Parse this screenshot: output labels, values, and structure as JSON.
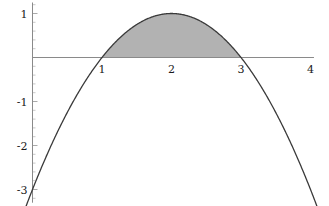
{
  "chart_data": {
    "type": "line",
    "title": "",
    "subtitle": "",
    "xlabel": "",
    "ylabel": "",
    "xlim": [
      -0.48,
      4.25
    ],
    "ylim": [
      -3.3,
      1.3
    ],
    "grid": false,
    "legend": null,
    "background_color": "#ffffff",
    "curve_color": "#3a3a3a",
    "axis_color": "#8a8a8a",
    "shade_color": "#b2b2b2",
    "series": [
      {
        "name": "-x^2 + 4x - 3",
        "type": "line",
        "expression": "y = -(x-2)^2 + 1",
        "color": "#3a3a3a",
        "x": [
          -0.4,
          -0.2,
          0,
          0.2,
          0.4,
          0.6,
          0.8,
          1.0,
          1.2,
          1.4,
          1.6,
          1.8,
          2.0,
          2.2,
          2.4,
          2.6,
          2.8,
          3.0,
          3.2,
          3.4,
          3.6,
          3.8,
          4.0,
          4.1
        ],
        "y": [
          -2.76,
          -1.84,
          -3.0,
          -2.24,
          -1.56,
          -0.96,
          -0.44,
          0.0,
          0.36,
          0.64,
          0.84,
          0.96,
          1.0,
          0.96,
          0.84,
          0.64,
          0.36,
          0.0,
          -0.44,
          -0.96,
          -1.56,
          -2.24,
          -3.0,
          -3.41
        ]
      }
    ],
    "shaded_region": {
      "label": "area under curve between roots",
      "from_x": 1,
      "to_x": 3,
      "baseline_y": 0,
      "color": "#b2b2b2"
    },
    "x_axis": {
      "tick_values": [
        1,
        2,
        3,
        4
      ],
      "tick_labels": [
        "1",
        "2",
        "3",
        "4"
      ],
      "line_from_x": -0.45,
      "line_to_x": 4.05,
      "minor_ticks": false
    },
    "y_axis": {
      "tick_values": [
        1,
        -1,
        -2,
        -3
      ],
      "tick_labels": [
        "1",
        "-1",
        "-2",
        "-3"
      ],
      "line_from_y": -3.3,
      "line_to_y": 1.25,
      "minor_ticks": true,
      "minor_tick_step": 0.2
    }
  }
}
